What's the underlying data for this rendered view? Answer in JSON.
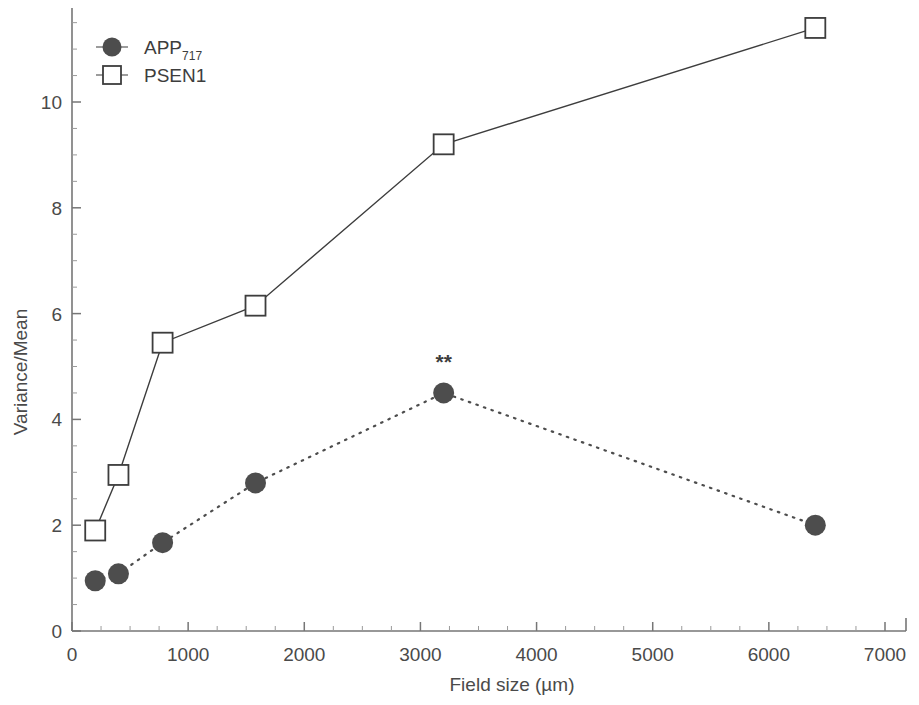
{
  "chart_data": {
    "type": "line",
    "title": "",
    "xlabel": "Field size (µm)",
    "ylabel": "Variance/Mean",
    "xlim": [
      0,
      7000
    ],
    "ylim": [
      0,
      11.9
    ],
    "grid": false,
    "legend_position": "top-left",
    "xticks": [
      0,
      1000,
      2000,
      3000,
      4000,
      5000,
      6000,
      7000
    ],
    "xtick_labels": [
      "0",
      "1000",
      "2000",
      "3000",
      "4000",
      "5000",
      "6000",
      "7000"
    ],
    "yticks": [
      0,
      2,
      4,
      6,
      8,
      10
    ],
    "ytick_labels": [
      "0",
      "2",
      "4",
      "6",
      "8",
      "10"
    ],
    "series": [
      {
        "name": "APP717",
        "legend_label": "APP",
        "legend_subscript": "717",
        "marker": "filled-circle",
        "line_style": "dotted",
        "color": "#4d4d4d",
        "x": [
          200,
          400,
          780,
          1580,
          3200,
          6400
        ],
        "values": [
          0.95,
          1.08,
          1.67,
          2.8,
          4.5,
          2.0
        ]
      },
      {
        "name": "PSEN1",
        "legend_label": "PSEN1",
        "legend_subscript": "",
        "marker": "open-square",
        "line_style": "solid",
        "color": "#3d3d3d",
        "x": [
          200,
          400,
          780,
          1580,
          3200,
          6400
        ],
        "values": [
          1.9,
          2.95,
          5.45,
          6.15,
          9.2,
          11.4
        ]
      }
    ],
    "annotations": [
      {
        "text": "**",
        "x": 3200,
        "y": 4.5,
        "series": "APP717",
        "meaning": "significance-marker"
      }
    ]
  },
  "axes": {
    "y_axis_title": "Variance/Mean",
    "x_axis_title": "Field size (µm)"
  },
  "legend": {
    "entries": [
      {
        "label": "APP",
        "subscript": "717",
        "marker": "filled-circle"
      },
      {
        "label": "PSEN1",
        "subscript": "",
        "marker": "open-square"
      }
    ]
  }
}
